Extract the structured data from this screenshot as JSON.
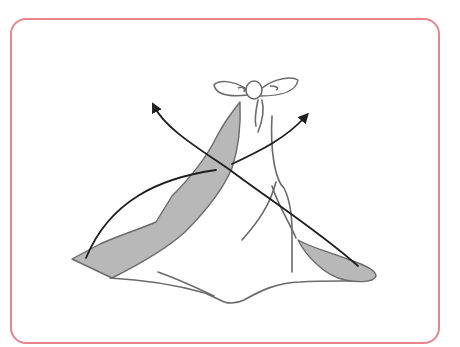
{
  "illustration": {
    "description": "Furoshiki wrapping step: two corners of a tied cloth bundle crossed over toward the opposite sides, indicated by curved arrows",
    "frame_color": "#e8848c",
    "cloth_shade_color": "#b8b8b8",
    "outline_color": "#6a6a6a",
    "arrow_color": "#1e1e1e",
    "elements": [
      "bow-knot",
      "cloth-bundle",
      "left-shaded-corner",
      "right-shaded-corner",
      "arrow-left-to-upper-right",
      "arrow-right-to-upper-left"
    ]
  }
}
